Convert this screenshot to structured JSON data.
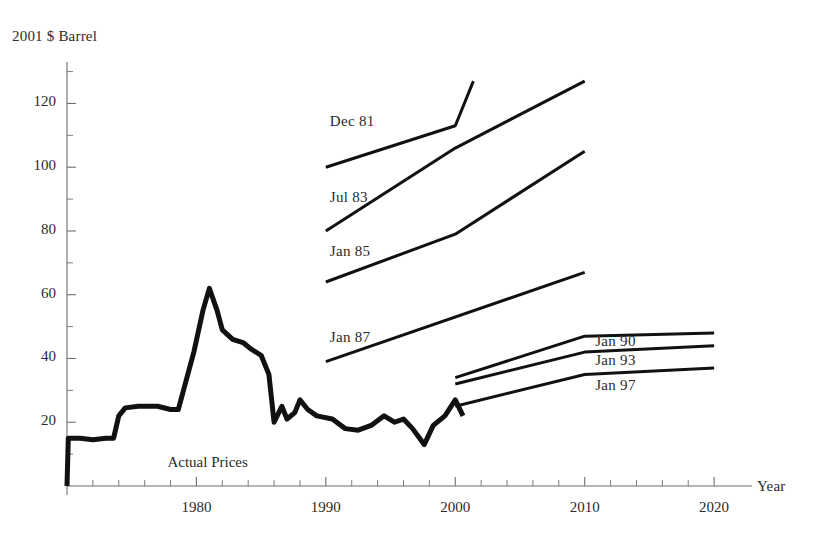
{
  "chart_data": {
    "type": "line",
    "title": "",
    "ylabel": "2001 $ Barrel",
    "xlabel": "Year",
    "xlim": [
      1970,
      2022
    ],
    "ylim": [
      0,
      133
    ],
    "xticks": [
      1980,
      1990,
      2000,
      2010,
      2020
    ],
    "xtick_labels": [
      "1980",
      "1990",
      "2000",
      "2010",
      "2020"
    ],
    "yticks": [
      20,
      40,
      60,
      80,
      100,
      120
    ],
    "ytick_labels": [
      "20",
      "40",
      "60",
      "80",
      "100",
      "120"
    ],
    "minor_ytick_step": 10,
    "minor_xtick_step": 2,
    "grid": false,
    "legend": "none",
    "series": [
      {
        "name": "Actual Prices",
        "label": "Actual Prices",
        "kind": "actual",
        "points": [
          [
            1970.0,
            0
          ],
          [
            1970.1,
            15
          ],
          [
            1971.0,
            15
          ],
          [
            1972.0,
            14.5
          ],
          [
            1973.0,
            15
          ],
          [
            1973.6,
            15
          ],
          [
            1974.0,
            22
          ],
          [
            1974.5,
            24.5
          ],
          [
            1975.5,
            25
          ],
          [
            1977.0,
            25
          ],
          [
            1978.0,
            24
          ],
          [
            1978.6,
            24
          ],
          [
            1979.0,
            30
          ],
          [
            1979.8,
            42
          ],
          [
            1980.5,
            55
          ],
          [
            1981.0,
            62
          ],
          [
            1981.6,
            55
          ],
          [
            1982.0,
            49
          ],
          [
            1982.8,
            46
          ],
          [
            1983.6,
            45
          ],
          [
            1984.2,
            43
          ],
          [
            1985.0,
            41
          ],
          [
            1985.6,
            35
          ],
          [
            1986.0,
            20
          ],
          [
            1986.6,
            25
          ],
          [
            1987.0,
            21
          ],
          [
            1987.6,
            23
          ],
          [
            1988.0,
            27
          ],
          [
            1988.6,
            24
          ],
          [
            1989.3,
            22
          ],
          [
            1990.5,
            21
          ],
          [
            1991.5,
            18
          ],
          [
            1992.5,
            17.5
          ],
          [
            1993.5,
            19
          ],
          [
            1994.5,
            22
          ],
          [
            1995.3,
            20
          ],
          [
            1996.0,
            21
          ],
          [
            1996.7,
            18
          ],
          [
            1997.6,
            13
          ],
          [
            1998.3,
            19
          ],
          [
            1999.2,
            22
          ],
          [
            2000.0,
            27
          ],
          [
            2000.6,
            22
          ]
        ]
      },
      {
        "name": "Dec 81",
        "label": "Dec  81",
        "month": "Dec",
        "year_short": "81",
        "kind": "forecast",
        "points": [
          [
            1990,
            100
          ],
          [
            2000,
            113
          ],
          [
            2001.4,
            127
          ]
        ]
      },
      {
        "name": "Jul 83",
        "label": "Jul  83",
        "month": "Jul",
        "year_short": "83",
        "kind": "forecast",
        "points": [
          [
            1990,
            80
          ],
          [
            2000,
            106
          ],
          [
            2010,
            127
          ]
        ]
      },
      {
        "name": "Jan 85",
        "label": "Jan  85",
        "month": "Jan",
        "year_short": "85",
        "kind": "forecast",
        "points": [
          [
            1990,
            64
          ],
          [
            2000,
            79
          ],
          [
            2010,
            105
          ]
        ]
      },
      {
        "name": "Jan 87",
        "label": "Jan  87",
        "month": "Jan",
        "year_short": "87",
        "kind": "forecast",
        "points": [
          [
            1990,
            39
          ],
          [
            2010,
            67
          ]
        ]
      },
      {
        "name": "Jan 90",
        "label": "Jan  90",
        "month": "Jan",
        "year_short": "90",
        "kind": "forecast",
        "points": [
          [
            2000,
            34
          ],
          [
            2010,
            47
          ],
          [
            2020,
            48
          ]
        ]
      },
      {
        "name": "Jan 93",
        "label": "Jan  93",
        "month": "Jan",
        "year_short": "93",
        "kind": "forecast",
        "points": [
          [
            2000,
            32
          ],
          [
            2010,
            42
          ],
          [
            2020,
            44
          ]
        ]
      },
      {
        "name": "Jan 97",
        "label": "Jan  97",
        "month": "Jan",
        "year_short": "97",
        "kind": "forecast",
        "points": [
          [
            2000,
            25
          ],
          [
            2010,
            35
          ],
          [
            2020,
            37
          ]
        ]
      }
    ],
    "annotations": [
      {
        "name": "dec-81",
        "text": "Dec  81",
        "x": 1990.0,
        "y": 114
      },
      {
        "name": "jul-83",
        "text": "Jul  83",
        "x": 1990.0,
        "y": 90
      },
      {
        "name": "jan-85",
        "text": "Jan  85",
        "x": 1990.0,
        "y": 73
      },
      {
        "name": "jan-87",
        "text": "Jan  87",
        "x": 1990.0,
        "y": 46
      },
      {
        "name": "jan-90",
        "text": "Jan  90",
        "x": 2010.5,
        "y": 45
      },
      {
        "name": "jan-93",
        "text": "Jan  93",
        "x": 2010.5,
        "y": 39
      },
      {
        "name": "jan-97",
        "text": "Jan  97",
        "x": 2010.5,
        "y": 31
      },
      {
        "name": "actual-prices",
        "text": "Actual Prices",
        "x": 1980.0,
        "y": 7
      }
    ],
    "colors": {
      "line": "#111111",
      "axis": "#6e6e6e",
      "text": "#2b2b2b",
      "background": "#ffffff"
    }
  }
}
